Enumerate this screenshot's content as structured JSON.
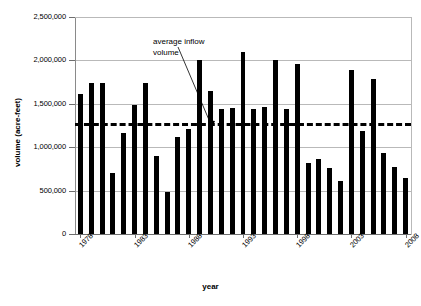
{
  "chart_data": {
    "type": "bar",
    "title": "",
    "xlabel": "year",
    "ylabel": "volume (acre-feet)",
    "ylim": [
      0,
      2500000
    ],
    "ytick_labels": [
      "2,500,000",
      "2,000,000",
      "1,500,000",
      "1,000,000",
      "500,000",
      "0"
    ],
    "ytick_values": [
      2500000,
      2000000,
      1500000,
      1000000,
      500000,
      0
    ],
    "xtick_labels": [
      "1978",
      "1983",
      "1988",
      "1993",
      "1998",
      "2003",
      "2008"
    ],
    "xtick_values": [
      1978,
      1983,
      1988,
      1993,
      1998,
      2003,
      2008
    ],
    "grid": true,
    "legend": "none",
    "categories": [
      1978,
      1979,
      1980,
      1981,
      1982,
      1983,
      1984,
      1985,
      1986,
      1987,
      1988,
      1989,
      1990,
      1991,
      1992,
      1993,
      1994,
      1995,
      1996,
      1997,
      1998,
      1999,
      2000,
      2001,
      2002,
      2003,
      2004,
      2005,
      2006,
      2007,
      2008
    ],
    "values": [
      1610000,
      1745000,
      1745000,
      700000,
      1160000,
      1490000,
      1745000,
      900000,
      480000,
      1120000,
      1210000,
      2000000,
      1650000,
      1440000,
      1450000,
      2100000,
      1440000,
      1460000,
      2010000,
      1440000,
      1960000,
      820000,
      860000,
      760000,
      610000,
      1890000,
      1190000,
      1790000,
      930000,
      770000,
      640000
    ],
    "average_line": {
      "value": 1280000,
      "label": "average inflow volume",
      "style": "dashed"
    }
  },
  "annotation": {
    "line1": "average inflow",
    "line2": "volume"
  },
  "colors": {
    "bar": "#000000",
    "grid": "#b9b9b9",
    "axis": "#6e6e6e",
    "average": "#000000",
    "background": "#ffffff"
  }
}
